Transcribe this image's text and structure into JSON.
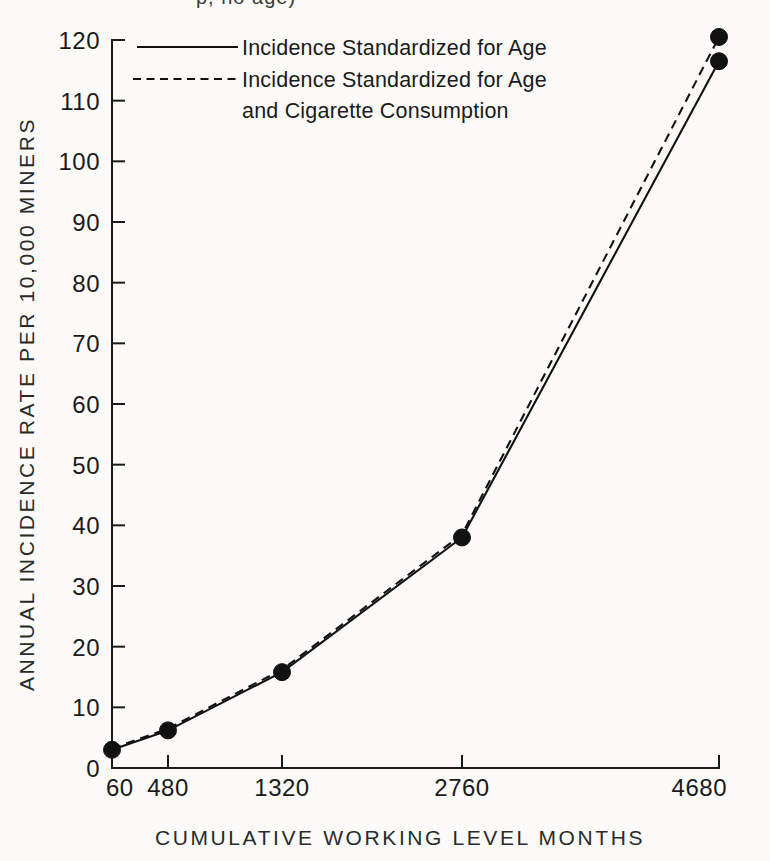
{
  "figure": {
    "background_color": "#fcfbf9",
    "ink_color": "#111111",
    "cropped_top_text": "p, no age)"
  },
  "chart_data": {
    "type": "line",
    "title": "",
    "xlabel": "CUMULATIVE  WORKING  LEVEL  MONTHS",
    "ylabel": "ANNUAL  INCIDENCE  RATE  PER  10,000  MINERS",
    "categories": [
      "60",
      "480",
      "1320",
      "2760",
      "4680"
    ],
    "x": [
      60,
      480,
      1320,
      2760,
      4680
    ],
    "x_pixel_positions": [
      112,
      168,
      282,
      462,
      719
    ],
    "x_scale": "non-linear (ordinal-like spacing)",
    "ylim": [
      0,
      120
    ],
    "y_ticks": [
      0,
      10,
      20,
      30,
      40,
      50,
      60,
      70,
      80,
      90,
      100,
      110,
      120
    ],
    "y_tick_labels": [
      "0",
      "10",
      "20",
      "30",
      "40",
      "50",
      "60",
      "70",
      "80",
      "90",
      "100",
      "110",
      "120"
    ],
    "grid": false,
    "legend_position": "top-center",
    "marker": "filled-circle",
    "series": [
      {
        "name": "Incidence Standardized for Age",
        "style": "solid",
        "values": [
          3.0,
          6.2,
          15.8,
          38.0,
          116.5
        ]
      },
      {
        "name": "Incidence Standardized for Age and Cigarette Consumption",
        "style": "dashed",
        "values": [
          3.2,
          6.5,
          16.2,
          38.5,
          120.5
        ]
      }
    ]
  },
  "legend": {
    "entries": [
      {
        "style": "solid",
        "line1": "Incidence Standardized for Age",
        "line2": ""
      },
      {
        "style": "dashed",
        "line1": "Incidence Standardized for Age",
        "line2": "and Cigarette Consumption"
      }
    ]
  },
  "axes": {
    "y_title": "ANNUAL  INCIDENCE  RATE  PER  10,000  MINERS",
    "x_title": "CUMULATIVE  WORKING  LEVEL  MONTHS"
  }
}
